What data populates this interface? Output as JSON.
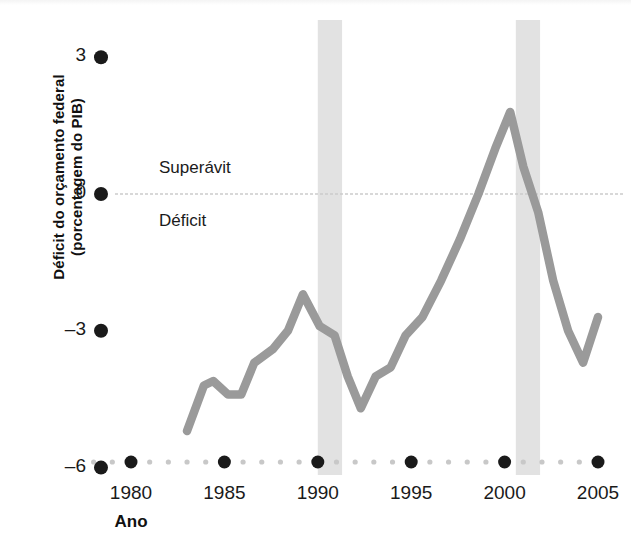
{
  "chart_data": {
    "type": "line",
    "title": "",
    "subtitle": "",
    "xlabel": "Ano",
    "ylabel": "Déficit do orçamento federal (porcentagem do PIB)",
    "ylabel_line1": "Déficit do orçamento federal",
    "ylabel_line2": "(porcentagem do PIB)",
    "xlim": [
      1978,
      2005.5
    ],
    "ylim": [
      -6,
      3
    ],
    "yticks": [
      3,
      0,
      -3,
      -6
    ],
    "ytick_labels": [
      "3",
      "0",
      "–3",
      "–6"
    ],
    "xticks": [
      1980,
      1985,
      1990,
      1995,
      2000,
      2005
    ],
    "xtick_labels": [
      "1980",
      "1985",
      "1990",
      "1995",
      "2000",
      "2005"
    ],
    "xminor_step": 1,
    "grid": false,
    "zero_line": 0,
    "legend": "none",
    "line_color": "#9a9a9a",
    "band_color": "#e2e2e2",
    "tick_dot_color": "#1a1a1a",
    "annotations": [
      {
        "name": "surplus-label",
        "text": "Superávit",
        "x": 1981.5,
        "y": 0.55
      },
      {
        "name": "deficit-label",
        "text": "Déficit",
        "x": 1981.5,
        "y": -0.62
      }
    ],
    "shaded_bands": [
      {
        "name": "recession-1990",
        "start": 1990.0,
        "end": 1991.3
      },
      {
        "name": "recession-2000",
        "start": 2000.6,
        "end": 2001.9
      }
    ],
    "x": [
      1983.0,
      1983.9,
      1984.4,
      1985.2,
      1985.9,
      1986.6,
      1987.6,
      1988.4,
      1989.2,
      1990.1,
      1990.9,
      1991.6,
      1992.3,
      1993.1,
      1993.9,
      1994.7,
      1995.6,
      1996.6,
      1997.6,
      1998.6,
      1999.5,
      2000.3,
      2001.0,
      2001.8,
      2002.6,
      2003.4,
      2004.2,
      2005.0
    ],
    "y": [
      -5.2,
      -4.2,
      -4.1,
      -4.4,
      -4.4,
      -3.7,
      -3.4,
      -3.0,
      -2.2,
      -2.9,
      -3.1,
      -4.0,
      -4.7,
      -4.0,
      -3.8,
      -3.1,
      -2.7,
      -1.9,
      -1.0,
      0.0,
      1.0,
      1.8,
      0.6,
      -0.4,
      -1.9,
      -3.0,
      -3.7,
      -2.7
    ],
    "values_note": "Percentual do PIB; valores negativos indicam déficit"
  },
  "axis": {
    "y_title_line1": "Déficit do orçamento federal",
    "y_title_line2": "(porcentagem do PIB)",
    "x_title": "Ano"
  }
}
